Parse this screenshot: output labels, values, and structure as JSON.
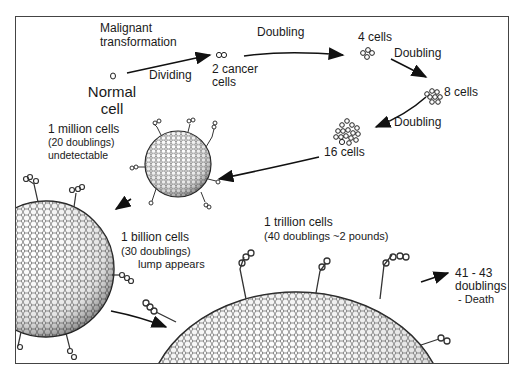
{
  "diagram": {
    "stages": [
      {
        "id": "normal",
        "label_line1": "Normal",
        "label_line2": "cell"
      },
      {
        "id": "two",
        "label_line1": "2 cancer",
        "label_line2": "cells"
      },
      {
        "id": "four",
        "label": "4 cells"
      },
      {
        "id": "eight",
        "label": "8 cells"
      },
      {
        "id": "sixteen",
        "label": "16 cells"
      },
      {
        "id": "million",
        "label": "1 million cells",
        "sub1": "(20 doublings)",
        "sub2": "undetectable"
      },
      {
        "id": "billion",
        "label": "1 billion cells",
        "sub1": "(30 doublings)",
        "sub2": "lump appears"
      },
      {
        "id": "trillion",
        "label": "1 trillion cells",
        "sub1": "(40 doublings ~2 pounds)"
      },
      {
        "id": "death",
        "line1": "41 - 43",
        "line2": "doublings",
        "line3": "- Death"
      }
    ],
    "transitions": {
      "malignant_line1": "Malignant",
      "malignant_line2": "transformation",
      "dividing": "Dividing",
      "doubling_1": "Doubling",
      "doubling_2": "Doubling",
      "doubling_3": "Doubling"
    }
  }
}
